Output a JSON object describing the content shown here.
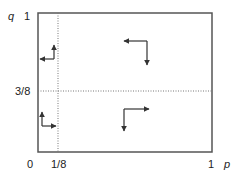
{
  "diagram": {
    "axes": {
      "x_label": "p",
      "y_label": "q",
      "x_ticks": [
        "0",
        "1/8",
        "1"
      ],
      "y_ticks": [
        "1",
        "3/8"
      ]
    },
    "thresholds": {
      "p": 0.125,
      "q": 0.375
    },
    "regions": [
      {
        "name": "top-left",
        "horizontal": "left",
        "vertical": "up"
      },
      {
        "name": "top-right",
        "horizontal": "left",
        "vertical": "down"
      },
      {
        "name": "bottom-left",
        "horizontal": "right",
        "vertical": "up"
      },
      {
        "name": "bottom-right",
        "horizontal": "right",
        "vertical": "down"
      }
    ],
    "colors": {
      "frame": "#555555",
      "dotted": "#777777",
      "arrow": "#333333"
    }
  }
}
